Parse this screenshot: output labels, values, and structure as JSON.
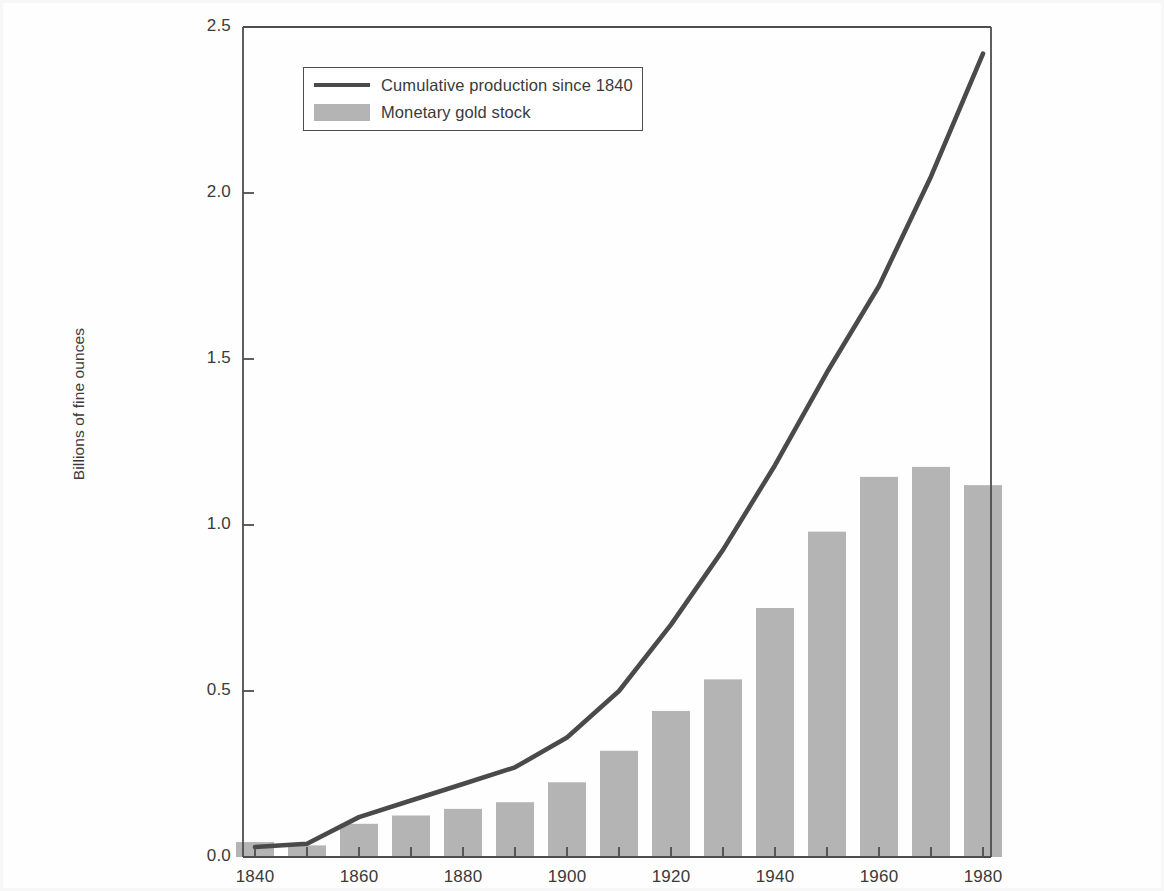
{
  "chart_data": {
    "type": "bar",
    "title": "",
    "xlabel": "",
    "ylabel": "Billions of fine ounces",
    "xlim": [
      1835,
      1985
    ],
    "ylim": [
      0.0,
      2.5
    ],
    "grid": false,
    "legend_position": "upper-left-inside",
    "categories": [
      1840,
      1850,
      1860,
      1870,
      1880,
      1890,
      1900,
      1910,
      1920,
      1930,
      1940,
      1950,
      1960,
      1970,
      1980
    ],
    "x_tick_labels": [
      "1840",
      "1860",
      "1880",
      "1900",
      "1920",
      "1940",
      "1960",
      "1980"
    ],
    "x_tick_values": [
      1840,
      1860,
      1880,
      1900,
      1920,
      1940,
      1960,
      1980
    ],
    "x_minor_ticks": [
      1850,
      1870,
      1890,
      1910,
      1930,
      1950,
      1970
    ],
    "y_tick_labels": [
      "0.0",
      "0.5",
      "1.0",
      "1.5",
      "2.0",
      "2.5"
    ],
    "y_tick_values": [
      0.0,
      0.5,
      1.0,
      1.5,
      2.0,
      2.5
    ],
    "series": [
      {
        "name": "Monetary gold stock",
        "type": "bar",
        "color": "#b4b4b4",
        "values": [
          0.045,
          0.035,
          0.1,
          0.125,
          0.145,
          0.165,
          0.225,
          0.32,
          0.44,
          0.535,
          0.75,
          0.98,
          1.145,
          1.175,
          1.12
        ]
      },
      {
        "name": "Cumulative production since 1840",
        "type": "line",
        "color": "#4a4a4a",
        "x": [
          1840,
          1850,
          1860,
          1870,
          1880,
          1890,
          1900,
          1910,
          1920,
          1930,
          1940,
          1950,
          1960,
          1970,
          1980
        ],
        "values": [
          0.03,
          0.04,
          0.12,
          0.17,
          0.22,
          0.27,
          0.36,
          0.5,
          0.7,
          0.925,
          1.18,
          1.46,
          1.72,
          2.05,
          2.42
        ]
      }
    ]
  },
  "legend": {
    "entries": [
      {
        "label": "Cumulative production since 1840",
        "marker": "line"
      },
      {
        "label": "Monetary gold stock",
        "marker": "swatch"
      }
    ]
  },
  "colors": {
    "bar_fill": "#b4b4b4",
    "line_stroke": "#4a4a4a",
    "axis": "#4d4d4d",
    "text": "#3a3a3a",
    "background": "#fefefe"
  }
}
